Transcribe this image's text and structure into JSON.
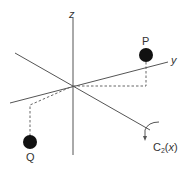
{
  "diagram": {
    "axes": {
      "z": {
        "label": "z"
      },
      "y": {
        "label": "y"
      },
      "x": {
        "label": "x"
      }
    },
    "points": [
      {
        "id": "P",
        "label": "P"
      },
      {
        "id": "Q",
        "label": "Q"
      }
    ],
    "rotation": {
      "label_main": "C",
      "label_sub": "2",
      "label_axis_open": "(",
      "label_axis": "x",
      "label_axis_close": ")"
    },
    "colors": {
      "axis": "#555555",
      "atom": "#111111",
      "text": "#333333"
    }
  }
}
